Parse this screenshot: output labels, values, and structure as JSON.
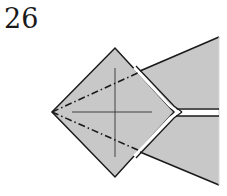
{
  "diagram": {
    "type": "origami-step",
    "step_number": "26",
    "colors": {
      "paper_fill": "#c8c8c8",
      "line": "#1a1a1a",
      "background": "#ffffff"
    },
    "elements": {
      "diamond": "square flap rotated 45°, left point with dash-dot valley/mountain fold lines",
      "crosshair": "thin reference cross inside diamond",
      "tail": "triangular paper extending to the right, split by a white slit"
    }
  }
}
